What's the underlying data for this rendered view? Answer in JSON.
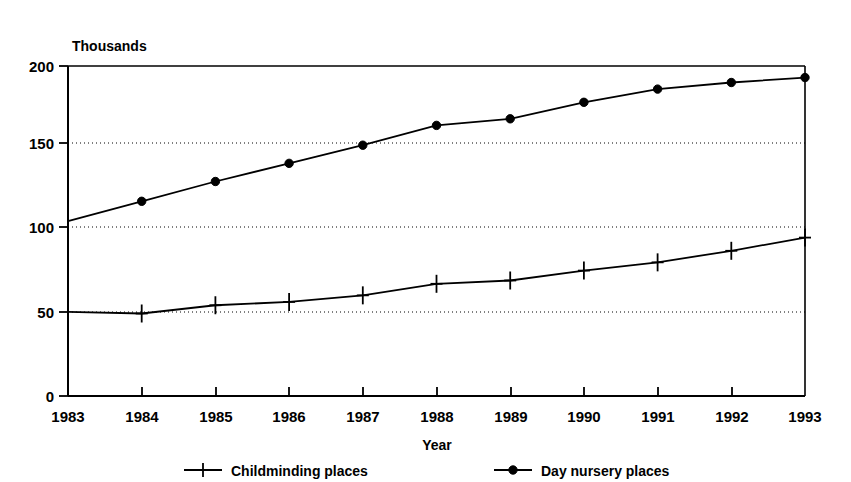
{
  "chart_data": {
    "type": "line",
    "title": "",
    "subtitle": "",
    "unit_label": "Thousands",
    "xlabel": "Year",
    "ylabel": "",
    "categories": [
      "1983",
      "1984",
      "1985",
      "1986",
      "1987",
      "1988",
      "1989",
      "1990",
      "1991",
      "1992",
      "1993"
    ],
    "x": [
      1983,
      1984,
      1985,
      1986,
      1987,
      1988,
      1989,
      1990,
      1991,
      1992,
      1993
    ],
    "series": [
      {
        "name": "Childminding places",
        "marker": "plus",
        "values": [
          51,
          50,
          55,
          57,
          61,
          68,
          70,
          76,
          81,
          88,
          96
        ]
      },
      {
        "name": "Day nursery places",
        "marker": "dot",
        "values": [
          106,
          118,
          130,
          141,
          152,
          164,
          168,
          178,
          186,
          190,
          193
        ]
      }
    ],
    "ylim": [
      0,
      200
    ],
    "yticks": [
      0,
      50,
      100,
      150,
      200
    ],
    "ytick_labels": [
      "0",
      "50",
      "100",
      "150",
      "200"
    ],
    "xtick_labels": [
      "1983",
      "1984",
      "1985",
      "1986",
      "1987",
      "1988",
      "1989",
      "1990",
      "1991",
      "1992",
      "1993"
    ],
    "grid": "horizontal-dotted",
    "gridlines_at": [
      50,
      100,
      150
    ],
    "legend_position": "bottom",
    "line_color": "#000000",
    "background_color": "#ffffff"
  },
  "legend": {
    "entries": [
      {
        "label": "Childminding places",
        "marker": "plus-marker-icon"
      },
      {
        "label": "Day nursery places",
        "marker": "dot-marker-icon"
      }
    ]
  },
  "axes": {
    "y_unit": "Thousands",
    "x_title": "Year"
  }
}
